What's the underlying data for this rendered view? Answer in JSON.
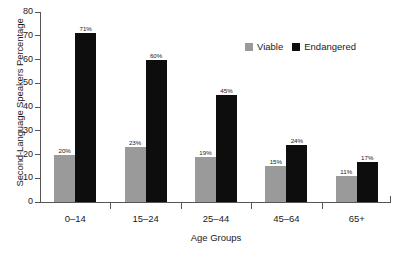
{
  "chart_data": {
    "type": "bar",
    "title": "",
    "xlabel": "Age Groups",
    "ylabel": "Second-Language Speakers Percentage",
    "categories": [
      "0–14",
      "15–24",
      "25–44",
      "45–64",
      "65+"
    ],
    "series": [
      {
        "name": "Viable",
        "color": "#9a9a9a",
        "values": [
          20,
          23,
          19,
          15,
          11
        ],
        "labels": [
          "20%",
          "23%",
          "19%",
          "15%",
          "11%"
        ]
      },
      {
        "name": "Endangered",
        "color": "#0d0d0d",
        "values": [
          71,
          60,
          45,
          24,
          17
        ],
        "labels": [
          "71%",
          "60%",
          "45%",
          "24%",
          "17%"
        ]
      }
    ],
    "ylim": [
      0,
      80
    ],
    "ytick_values": [
      0,
      10,
      20,
      30,
      40,
      50,
      60,
      70,
      80
    ],
    "ytick_labels": [
      "0",
      "10",
      "20",
      "30",
      "40",
      "50",
      "60",
      "70",
      "80"
    ],
    "grid": false,
    "legend_position": "top-right"
  },
  "legend": {
    "entries": [
      {
        "label": "Viable",
        "color": "#9a9a9a"
      },
      {
        "label": "Endangered",
        "color": "#0d0d0d"
      }
    ]
  },
  "colors": {
    "viable": "#9a9a9a",
    "endangered": "#0d0d0d",
    "axis": "#555555",
    "text": "#1a1a1a",
    "background": "#ffffff"
  }
}
